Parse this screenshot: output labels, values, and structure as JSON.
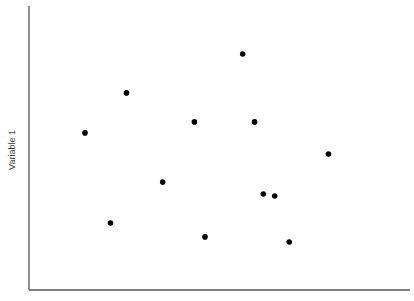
{
  "chart_data": {
    "type": "scatter",
    "title": "",
    "xlabel": "",
    "ylabel": "Variable 1",
    "xlim": [
      0,
      100
    ],
    "ylim": [
      0,
      100
    ],
    "grid": false,
    "legend": null,
    "ticks": "none",
    "points": [
      {
        "x": 56.1,
        "y": 83.1
      },
      {
        "x": 25.6,
        "y": 69.4
      },
      {
        "x": 14.7,
        "y": 55.3
      },
      {
        "x": 43.4,
        "y": 59.2
      },
      {
        "x": 59.2,
        "y": 59.2
      },
      {
        "x": 78.6,
        "y": 47.9
      },
      {
        "x": 35.1,
        "y": 38.0
      },
      {
        "x": 61.5,
        "y": 33.8
      },
      {
        "x": 64.5,
        "y": 33.1
      },
      {
        "x": 21.4,
        "y": 23.6
      },
      {
        "x": 46.2,
        "y": 18.7
      },
      {
        "x": 68.3,
        "y": 16.9
      }
    ],
    "colors": {
      "point": "#000000",
      "axis": "#555555",
      "label": "#444444"
    }
  },
  "plot_area": {
    "x0": 29,
    "y0": 6,
    "x1": 410,
    "y1": 290
  }
}
